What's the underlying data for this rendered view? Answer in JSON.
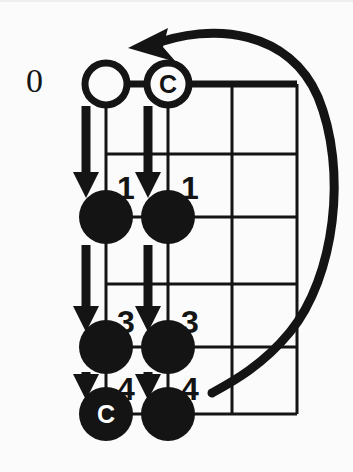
{
  "diagram": {
    "type": "fretboard-diagram",
    "colors": {
      "ink": "#141414",
      "background": "#fbfbfb",
      "marker_text": "#ffffff"
    },
    "open_fret_label": "0",
    "grid": {
      "strings": 4,
      "frets": 5,
      "left": 106,
      "right": 297,
      "top": 82,
      "bottom": 412,
      "string_x": [
        106,
        168,
        232,
        297
      ],
      "fret_y": [
        82,
        152,
        215,
        282,
        345,
        412
      ],
      "nut_thickness": 7,
      "line_thickness": 3
    },
    "open_markers": [
      {
        "name": "open-string-1",
        "string": 1,
        "x": 106,
        "y": 82,
        "radius": 21,
        "label": ""
      },
      {
        "name": "open-string-2",
        "string": 2,
        "x": 168,
        "y": 82,
        "radius": 21,
        "label": "C"
      }
    ],
    "note_markers": [
      {
        "name": "note-s1-f2",
        "string": 1,
        "x": 106,
        "y": 215,
        "radius": 27,
        "label": "",
        "finger": "1"
      },
      {
        "name": "note-s2-f2",
        "string": 2,
        "x": 168,
        "y": 215,
        "radius": 27,
        "label": "",
        "finger": "1"
      },
      {
        "name": "note-s1-f4",
        "string": 1,
        "x": 106,
        "y": 345,
        "radius": 27,
        "label": "",
        "finger": "3"
      },
      {
        "name": "note-s2-f4",
        "string": 2,
        "x": 168,
        "y": 345,
        "radius": 27,
        "label": "",
        "finger": "3"
      },
      {
        "name": "note-s1-f5",
        "string": 1,
        "x": 106,
        "y": 412,
        "radius": 27,
        "label": "C",
        "finger": "4"
      },
      {
        "name": "note-s2-f5",
        "string": 2,
        "x": 168,
        "y": 412,
        "radius": 27,
        "label": "",
        "finger": "4"
      }
    ],
    "finger_labels": [
      {
        "name": "finger-label-1-left",
        "text": "1",
        "x": 126,
        "y": 186
      },
      {
        "name": "finger-label-1-right",
        "text": "1",
        "x": 190,
        "y": 186
      },
      {
        "name": "finger-label-3-left",
        "text": "3",
        "x": 126,
        "y": 320
      },
      {
        "name": "finger-label-3-right",
        "text": "3",
        "x": 190,
        "y": 320
      },
      {
        "name": "finger-label-4-left",
        "text": "4",
        "x": 126,
        "y": 387
      },
      {
        "name": "finger-label-4-right",
        "text": "4",
        "x": 190,
        "y": 387
      }
    ],
    "motion_arrows": [
      {
        "name": "arrow-s1-open-to-f2",
        "x": 86,
        "y_start": 104,
        "y_end": 196,
        "direction": "down"
      },
      {
        "name": "arrow-s2-open-to-f2",
        "x": 148,
        "y_start": 104,
        "y_end": 196,
        "direction": "down"
      },
      {
        "name": "arrow-s1-f2-to-f4",
        "x": 86,
        "y_start": 243,
        "y_end": 330,
        "direction": "down"
      },
      {
        "name": "arrow-s2-f2-to-f4",
        "x": 148,
        "y_start": 243,
        "y_end": 330,
        "direction": "down"
      },
      {
        "name": "arrow-s1-f4-to-f5",
        "x": 86,
        "y_start": 370,
        "y_end": 398,
        "direction": "down"
      },
      {
        "name": "arrow-s2-f4-to-f5",
        "x": 148,
        "y_start": 370,
        "y_end": 398,
        "direction": "down"
      }
    ],
    "return_arrow": {
      "name": "return-sweep-arrow",
      "description": "curved sweep from lower-right back to upper-left",
      "direction": "counterclockwise",
      "head_at": {
        "x": 131,
        "y": 45
      }
    }
  }
}
